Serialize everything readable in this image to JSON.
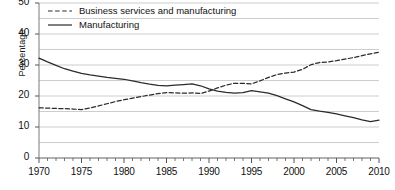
{
  "chart_data": {
    "type": "line",
    "title": "",
    "xlabel": "",
    "ylabel": "Percentage",
    "xlim": [
      1970,
      2010
    ],
    "ylim": [
      0,
      50
    ],
    "ytick_labels": [
      "0",
      "10",
      "20",
      "30",
      "40",
      "50"
    ],
    "ytick_values": [
      0,
      10,
      20,
      30,
      40,
      50
    ],
    "xtick_labels": [
      "1970",
      "1975",
      "1980",
      "1985",
      "1990",
      "1995",
      "2000",
      "2005",
      "2010"
    ],
    "xtick_values": [
      1970,
      1975,
      1980,
      1985,
      1990,
      1995,
      2000,
      2005,
      2010
    ],
    "minor_xtick_interval": 1,
    "grid": "horizontal-every-5",
    "legend_position": "top-left-inside",
    "x": [
      1970,
      1971,
      1972,
      1973,
      1974,
      1975,
      1976,
      1977,
      1978,
      1979,
      1980,
      1981,
      1982,
      1983,
      1984,
      1985,
      1986,
      1987,
      1988,
      1989,
      1990,
      1991,
      1992,
      1993,
      1994,
      1995,
      1996,
      1997,
      1998,
      1999,
      2000,
      2001,
      2002,
      2003,
      2004,
      2005,
      2006,
      2007,
      2008,
      2009,
      2010
    ],
    "series": [
      {
        "name": "Business services and manufacturing",
        "style": "dashed",
        "color": "#2b2b2b",
        "values": [
          16.2,
          16.1,
          16.0,
          15.9,
          15.8,
          15.6,
          16.1,
          16.8,
          17.5,
          18.2,
          18.8,
          19.3,
          19.8,
          20.3,
          20.8,
          21.1,
          21.0,
          20.9,
          21.0,
          20.8,
          21.6,
          22.6,
          23.5,
          24.1,
          24.1,
          23.9,
          24.9,
          26.0,
          26.9,
          27.4,
          27.7,
          28.6,
          30.1,
          30.8,
          31.0,
          31.4,
          31.9,
          32.4,
          33.0,
          33.6,
          34.1
        ]
      },
      {
        "name": "Manufacturing",
        "style": "solid",
        "color": "#2b2b2b",
        "values": [
          32.2,
          31.0,
          29.9,
          28.8,
          28.0,
          27.3,
          26.8,
          26.4,
          26.0,
          25.7,
          25.4,
          24.9,
          24.3,
          23.8,
          23.4,
          23.3,
          23.5,
          23.7,
          23.9,
          23.3,
          22.3,
          21.6,
          21.2,
          20.9,
          21.1,
          21.7,
          21.3,
          20.9,
          20.1,
          19.1,
          18.1,
          16.9,
          15.6,
          15.1,
          14.7,
          14.2,
          13.6,
          13.0,
          12.3,
          11.7,
          12.2
        ]
      }
    ]
  },
  "legend": {
    "items": [
      {
        "label": "Business services and manufacturing",
        "style": "dashed"
      },
      {
        "label": "Manufacturing",
        "style": "solid"
      }
    ]
  },
  "axis": {
    "y_title": "Percentage"
  }
}
